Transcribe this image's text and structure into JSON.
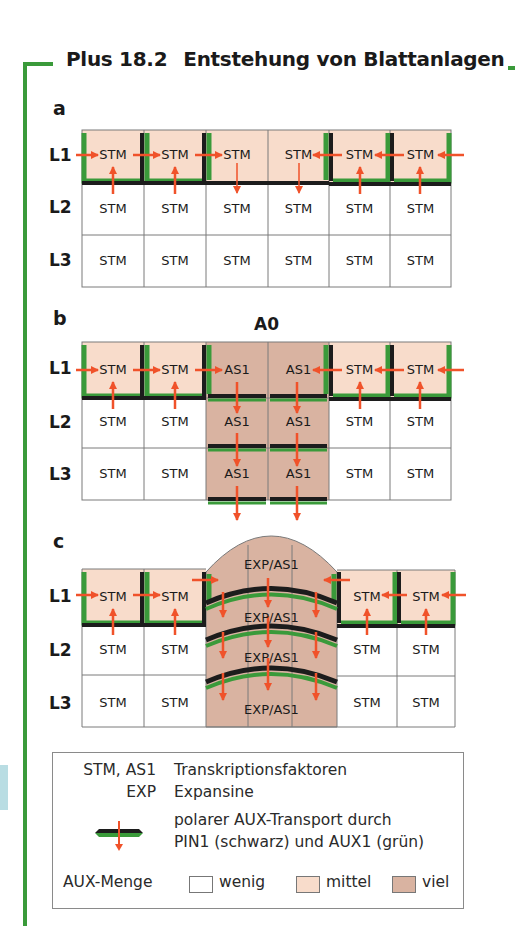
{
  "header": {
    "number": "Plus 18.2",
    "title": "Entstehung von Blattanlagen"
  },
  "colors": {
    "frame_green": "#3a9a3a",
    "auxin_low": "#ffffff",
    "auxin_mid": "#f8dccb",
    "auxin_high": "#d9b3a1",
    "pin1_black": "#1c1c1c",
    "aux1_green": "#3a9a3a",
    "arrow_orange": "#f0522a",
    "grid_line": "#7a7a7a"
  },
  "panels": [
    {
      "id": "a",
      "label": "a",
      "rows": [
        {
          "label": "L1",
          "cells": [
            "STM",
            "STM",
            "STM",
            "STM",
            "STM",
            "STM"
          ],
          "auxin": [
            "mittel",
            "mittel",
            "mittel",
            "mittel",
            "mittel",
            "mittel"
          ]
        },
        {
          "label": "L2",
          "cells": [
            "STM",
            "STM",
            "STM",
            "STM",
            "STM",
            "STM"
          ],
          "auxin": [
            "wenig",
            "wenig",
            "wenig",
            "wenig",
            "wenig",
            "wenig"
          ]
        },
        {
          "label": "L3",
          "cells": [
            "STM",
            "STM",
            "STM",
            "STM",
            "STM",
            "STM"
          ],
          "auxin": [
            "wenig",
            "wenig",
            "wenig",
            "wenig",
            "wenig",
            "wenig"
          ]
        }
      ]
    },
    {
      "id": "b",
      "label": "b",
      "annotation": "A0",
      "rows": [
        {
          "label": "L1",
          "cells": [
            "STM",
            "STM",
            "AS1",
            "AS1",
            "STM",
            "STM"
          ],
          "auxin": [
            "mittel",
            "mittel",
            "viel",
            "viel",
            "mittel",
            "mittel"
          ]
        },
        {
          "label": "L2",
          "cells": [
            "STM",
            "STM",
            "AS1",
            "AS1",
            "STM",
            "STM"
          ],
          "auxin": [
            "wenig",
            "wenig",
            "viel",
            "viel",
            "wenig",
            "wenig"
          ]
        },
        {
          "label": "L3",
          "cells": [
            "STM",
            "STM",
            "AS1",
            "AS1",
            "STM",
            "STM"
          ],
          "auxin": [
            "wenig",
            "wenig",
            "viel",
            "viel",
            "wenig",
            "wenig"
          ]
        }
      ]
    },
    {
      "id": "c",
      "label": "c",
      "rows": [
        {
          "label": "L1",
          "cells": [
            "STM",
            "STM",
            "STM",
            "STM"
          ],
          "auxin": [
            "mittel",
            "mittel",
            "mittel",
            "mittel"
          ]
        },
        {
          "label": "L2",
          "cells": [
            "STM",
            "STM",
            "STM",
            "STM"
          ],
          "auxin": [
            "wenig",
            "wenig",
            "wenig",
            "wenig"
          ]
        },
        {
          "label": "L3",
          "cells": [
            "STM",
            "STM",
            "STM",
            "STM"
          ],
          "auxin": [
            "wenig",
            "wenig",
            "wenig",
            "wenig"
          ]
        }
      ],
      "primordium_labels": [
        "EXP/AS1",
        "EXP/AS1",
        "EXP/AS1",
        "EXP/AS1"
      ]
    }
  ],
  "legend": {
    "items": [
      {
        "term": "STM, AS1",
        "description": "Transkriptionsfaktoren"
      },
      {
        "term": "EXP",
        "description": "Expansine"
      },
      {
        "term_icon": "pin1-aux1-transport-icon",
        "description_line1": "polarer AUX-Transport durch",
        "description_line2": "PIN1 (schwarz) und AUX1 (grün)"
      }
    ],
    "auxin_amount_label": "AUX-Menge",
    "auxin_levels": [
      {
        "label": "wenig",
        "color": "#ffffff"
      },
      {
        "label": "mittel",
        "color": "#f8dccb"
      },
      {
        "label": "viel",
        "color": "#d9b3a1"
      }
    ]
  }
}
